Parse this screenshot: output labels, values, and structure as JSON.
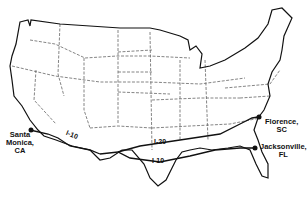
{
  "map": {
    "title": "United States interstate routes",
    "colors": {
      "outline": "#111111",
      "state_border": "#555555",
      "route": "#111111",
      "background": "#ffffff"
    },
    "cities": [
      {
        "name": "Santa Monica, CA",
        "line1": "Santa",
        "line2": "Monica,",
        "line3": "CA"
      },
      {
        "name": "Florence, SC",
        "line1": "Florence,",
        "line2": "SC"
      },
      {
        "name": "Jacksonville, FL",
        "line1": "Jacksonville,",
        "line2": "FL"
      }
    ],
    "routes": [
      {
        "label": "I-10",
        "segment": "west"
      },
      {
        "label": "I-20",
        "segment": "central"
      },
      {
        "label": "I-10",
        "segment": "south"
      }
    ]
  }
}
